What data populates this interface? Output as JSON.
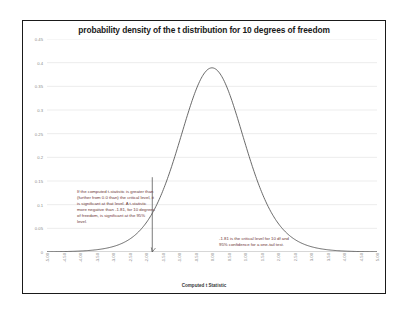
{
  "chart_data": {
    "type": "line",
    "title": "probability density of the t distribution for 10 degrees of freedom",
    "xlabel": "Computed t Statistic",
    "ylabel": "",
    "xlim": [
      -5.0,
      5.0
    ],
    "ylim": [
      0,
      0.45
    ],
    "grid": true,
    "legend": "none",
    "y_ticks": [
      "0.45",
      "0.4",
      "0.35",
      "0.3",
      "0.25",
      "0.2",
      "0.15",
      "0.1",
      "0.05",
      "0"
    ],
    "y_tick_values": [
      0.45,
      0.4,
      0.35,
      0.3,
      0.25,
      0.2,
      0.15,
      0.1,
      0.05,
      0
    ],
    "x_ticks": [
      "-5.00",
      "-4.50",
      "-4.00",
      "-3.50",
      "-3.00",
      "-2.50",
      "-2.00",
      "-1.50",
      "-1.00",
      "-0.50",
      "0.00",
      "0.50",
      "1.00",
      "1.50",
      "2.00",
      "2.50",
      "3.00",
      "3.50",
      "4.00",
      "4.50",
      "5.00"
    ],
    "x_tick_values": [
      -5.0,
      -4.5,
      -4.0,
      -3.5,
      -3.0,
      -2.5,
      -2.0,
      -1.5,
      -1.0,
      -0.5,
      0.0,
      0.5,
      1.0,
      1.5,
      2.0,
      2.5,
      3.0,
      3.5,
      4.0,
      4.5,
      5.0
    ],
    "series": [
      {
        "name": "t density (df=10)",
        "color": "#595959",
        "x": [
          -5.0,
          -4.75,
          -4.5,
          -4.25,
          -4.0,
          -3.75,
          -3.5,
          -3.25,
          -3.0,
          -2.75,
          -2.5,
          -2.25,
          -2.0,
          -1.75,
          -1.5,
          -1.25,
          -1.0,
          -0.75,
          -0.5,
          -0.25,
          0.0,
          0.25,
          0.5,
          0.75,
          1.0,
          1.25,
          1.5,
          1.75,
          2.0,
          2.25,
          2.5,
          2.75,
          3.0,
          3.25,
          3.5,
          3.75,
          4.0,
          4.25,
          4.5,
          4.75,
          5.0
        ],
        "y": [
          0.0014,
          0.0019,
          0.0027,
          0.0037,
          0.0051,
          0.0071,
          0.0099,
          0.0139,
          0.0196,
          0.0277,
          0.0388,
          0.0538,
          0.0737,
          0.0989,
          0.1296,
          0.1651,
          0.2031,
          0.2401,
          0.2722,
          0.2959,
          0.3891,
          0.2959,
          0.2722,
          0.2401,
          0.2031,
          0.1651,
          0.1296,
          0.0989,
          0.0737,
          0.0538,
          0.0388,
          0.0277,
          0.0196,
          0.0139,
          0.0099,
          0.0071,
          0.0051,
          0.0037,
          0.0027,
          0.0019,
          0.0014
        ]
      }
    ],
    "markers": [
      {
        "name": "critical-value-line",
        "x": -1.81,
        "label": "-1.81",
        "y_top": 0.158,
        "color": "#595959"
      }
    ],
    "annotations": [
      {
        "name": "explanation",
        "text": "If the computed t-statistic is greater than (further from 0.0 than) the critical level, it is significant at that level. A t-statistic more negative than -1.81, for 10 degrees of freedom, is significant at the 95% level."
      },
      {
        "name": "critical-value",
        "text": "-1.81 is the critical level for 10 df and 95% confidence for a one-tail test."
      }
    ]
  },
  "colors": {
    "frame": "#1a1a1a",
    "grid": "#d9d9d9",
    "curve": "#595959",
    "tick_text": "#8a8a8a",
    "annotation_text": "#6b3434",
    "background": "#ffffff"
  }
}
